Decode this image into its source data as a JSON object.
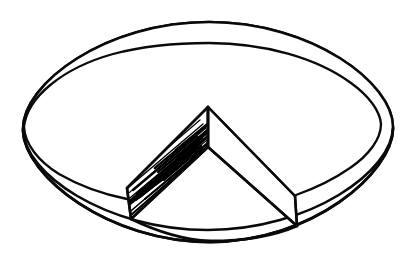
{
  "figure": {
    "title": "Hand-drawn 3D pie with cut-out wedge",
    "medium": "black ink line drawing",
    "background_color": "#ffffff",
    "ink_color": "#0a0a0a",
    "hatch_color": "#000000",
    "canvas": {
      "width": 417,
      "height": 254
    },
    "parts": [
      {
        "name": "top-ellipse-outer",
        "label": "outer rim of top face"
      },
      {
        "name": "top-ellipse-inner",
        "label": "inner edge of top face"
      },
      {
        "name": "bottom-ellipse",
        "label": "bottom silhouette arc"
      },
      {
        "name": "wedge-notch",
        "label": "cut-out pie slice"
      },
      {
        "name": "wedge-face-left",
        "label": "shaded left interior wall"
      },
      {
        "name": "wedge-face-right",
        "label": "plain right interior wall"
      },
      {
        "name": "hatching",
        "label": "diagonal pen shading"
      }
    ]
  },
  "geometry": {
    "disk": {
      "top_center": {
        "x": 208,
        "y": 76
      },
      "top_radius_x": 185,
      "top_radius_y": 54,
      "wall_height": 52,
      "left_silhouette": {
        "x": 23,
        "y": 130
      },
      "right_silhouette": {
        "x": 393,
        "y": 127
      }
    },
    "wedge": {
      "apex_top": {
        "x": 208,
        "y": 107
      },
      "apex_bottom": {
        "x": 208,
        "y": 147
      },
      "left_rim": {
        "x": 127,
        "y": 188
      },
      "left_foot": {
        "x": 131,
        "y": 219
      },
      "right_rim": {
        "x": 295,
        "y": 196
      },
      "right_foot": {
        "x": 297,
        "y": 226
      },
      "opening_angle_description": "roughly a 70 degree slice facing the viewer"
    },
    "hatching": {
      "direction": "lower-left to upper-right",
      "stroke_count": 64,
      "density": "dense at lower-left, fading toward lower-right"
    }
  },
  "strokes": {
    "top_ellipse_outer": "M 23,129 C 23,83 106,22 209,22 C 312,22 393,83 393,127 C 393,171 310,230 208,230 C 106,230 23,173 23,129 Z",
    "top_ellipse_inner_left": "M 24,127 C 28,95 104,50 209,50 C 290,50 354,78 378,105",
    "bottom_arc": "M 23,131 C 25,176 108,242 210,242 C 312,242 392,173 393,129",
    "wedge_left_top": "M 208,107 L 127,188",
    "wedge_left_vertical": "M 127,188 L 131,219",
    "wedge_left_bottom": "M 208,147 L 131,219",
    "wedge_center_vertical": "M 208,107 L 208,147",
    "wedge_right_top": "M 208,107 L 295,196",
    "wedge_right_vertical": "M 295,196 L 297,226",
    "wedge_right_bottom": "M 208,147 L 297,226"
  }
}
